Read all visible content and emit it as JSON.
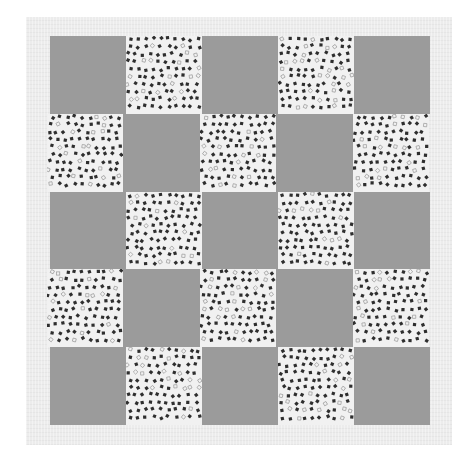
{
  "scene": {
    "subject": "quilt",
    "description": "5x5 checkerboard quilt of solid gray squares alternating with white squares printed with small scattered dark squares, laid on a light textured backing",
    "grid": {
      "rows": 5,
      "cols": 5
    },
    "layout": [
      [
        "solid",
        "print",
        "solid",
        "print",
        "solid"
      ],
      [
        "print",
        "solid",
        "print",
        "solid",
        "print"
      ],
      [
        "solid",
        "print",
        "solid",
        "print",
        "solid"
      ],
      [
        "print",
        "solid",
        "print",
        "solid",
        "print"
      ],
      [
        "solid",
        "print",
        "solid",
        "print",
        "solid"
      ]
    ]
  },
  "colors": {
    "page_background": "#ffffff",
    "backing": "#ececec",
    "solid_fabric": "#9b9b9b",
    "print_fabric_ground": "#f1f1f1",
    "print_motif_dark": "#2e2e2e",
    "print_motif_light": "#9a9a9a"
  }
}
